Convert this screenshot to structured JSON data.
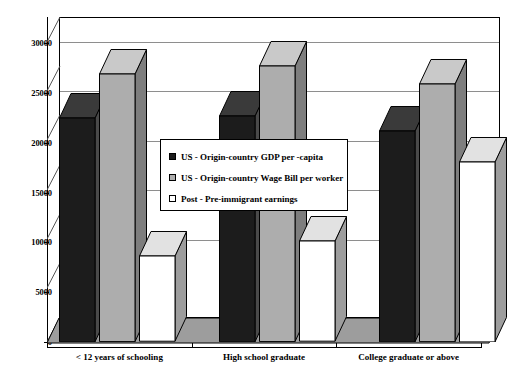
{
  "chart_data": {
    "type": "bar",
    "title": "",
    "subtitle": "",
    "xlabel": "",
    "ylabel": "",
    "ylim": [
      0,
      30000
    ],
    "yticks": [
      0,
      5000,
      10000,
      15000,
      20000,
      25000,
      30000
    ],
    "ytick_labels": [
      "0",
      "5000",
      "10000",
      "15000",
      "20000",
      "25000",
      "30000"
    ],
    "grid": true,
    "style": "3d-clustered-column",
    "legend_position": "center",
    "categories": [
      "< 12 years of schooling",
      "High school graduate",
      "College graduate or above"
    ],
    "series": [
      {
        "name": "US - Origin-country GDP per -capita",
        "color": "#1c1c1c",
        "values": [
          22500,
          22700,
          21200
        ]
      },
      {
        "name": "US - Origin-country Wage Bill per worker",
        "color": "#adadad",
        "values": [
          26900,
          27700,
          25900
        ]
      },
      {
        "name": "Post - Pre-immigrant earnings",
        "color": "#ffffff",
        "values": [
          8600,
          10100,
          18100
        ]
      }
    ]
  },
  "legend": {
    "items": [
      {
        "label": "US - Origin-country GDP per -capita",
        "swatch": "dark-swatch-icon"
      },
      {
        "label": "US - Origin-country Wage Bill per worker",
        "swatch": "gray-swatch-icon"
      },
      {
        "label": "Post - Pre-immigrant earnings",
        "swatch": "white-swatch-icon"
      }
    ]
  },
  "axes": {
    "y": {
      "labels": [
        "30000",
        "25000",
        "20000",
        "15000",
        "10000",
        "5000",
        "0"
      ]
    },
    "x": {
      "labels": [
        "< 12 years of schooling",
        "High school graduate",
        "College graduate or above"
      ]
    }
  },
  "colors": {
    "series_dark": "#1c1c1c",
    "series_gray": "#adadad",
    "series_white": "#ffffff",
    "floor": "#9d9d9d",
    "grid": "#8e8e8e",
    "axis": "#000000",
    "background": "#ffffff"
  }
}
